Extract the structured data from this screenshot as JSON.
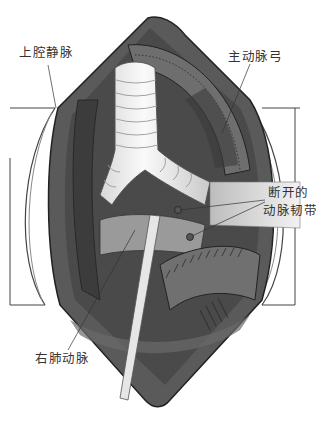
{
  "figure": {
    "colors": {
      "background": "#ffffff",
      "tissue_dark": "#4a4a4a",
      "tissue_mid": "#6b6b6b",
      "tissue_light": "#a8a8a8",
      "trachea": "#ececec",
      "outline": "#222222",
      "label_text": "#333333"
    }
  },
  "labels": {
    "svc": "上腔静脉",
    "aortic_arch": "主动脉弓",
    "ligament_line1": "断开的",
    "ligament_line2": "动脉韧带",
    "rpa": "右肺动脉"
  }
}
